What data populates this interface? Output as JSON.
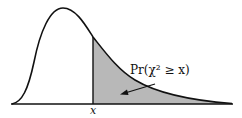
{
  "diagram": {
    "type": "chi-square-distribution-tail",
    "x_label": "x",
    "annotation": "Pr(χ² ≥ x)",
    "colors": {
      "curve": "#111111",
      "shaded_area": "#b8b8b8",
      "background": "#ffffff"
    }
  }
}
